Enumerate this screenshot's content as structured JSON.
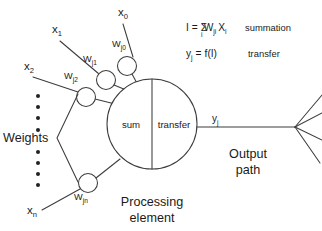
{
  "diagram": {
    "colors": {
      "stroke": "#3c3c3c",
      "text": "#1a1a1a",
      "background": "#ffffff"
    },
    "inputs": [
      {
        "id": "x0",
        "base": "x",
        "sub": "0",
        "x": 118,
        "y": 16
      },
      {
        "id": "x1",
        "base": "x",
        "sub": "1",
        "x": 52,
        "y": 33
      },
      {
        "id": "x2",
        "base": "x",
        "sub": "2",
        "x": 24,
        "y": 70
      },
      {
        "id": "xn",
        "base": "x",
        "sub": "n",
        "x": 27,
        "y": 214
      }
    ],
    "weights": [
      {
        "id": "wj0",
        "base": "W",
        "sub": "j0",
        "label_x": 112,
        "label_y": 47,
        "cx": 127,
        "cy": 66,
        "r": 9.5
      },
      {
        "id": "wj1",
        "base": "W",
        "sub": "j1",
        "label_x": 83,
        "label_y": 62,
        "cx": 106,
        "cy": 80,
        "r": 9.5
      },
      {
        "id": "wj2",
        "base": "W",
        "sub": "j2",
        "label_x": 64,
        "label_y": 79,
        "cx": 86,
        "cy": 97,
        "r": 9.5
      },
      {
        "id": "wjn",
        "base": "W",
        "sub": "jn",
        "label_x": 74,
        "label_y": 200,
        "cx": 88,
        "cy": 183,
        "r": 9.5
      }
    ],
    "processing_element": {
      "sum_label": "sum",
      "transfer_label": "transfer",
      "caption_line1": "Processing",
      "caption_line2": "element",
      "cx": 152,
      "cy": 124,
      "r": 45
    },
    "output": {
      "signal_base": "y",
      "signal_sub": "j",
      "caption_line1": "Output",
      "caption_line2": "path",
      "fan_branches": 4
    },
    "weights_bracket": {
      "label": "Weights",
      "label_x": 3,
      "label_y": 142
    },
    "vertical_dots": {
      "count": 9,
      "x": 38,
      "y_start": 96,
      "y_step": 11.2,
      "radius": 2.0
    },
    "formulas": [
      {
        "id": "summation",
        "lhs": "I",
        "eq": "=",
        "sigma": "Σ",
        "sigma_sub": "i",
        "term1": "W",
        "term1_sub": "ji",
        "term2": "X",
        "term2_sub": "i",
        "annotation": "summation"
      },
      {
        "id": "transfer",
        "lhs": "y",
        "lhs_sub": "j",
        "eq": "=",
        "rhs": "f(I)",
        "annotation": "transfer"
      }
    ]
  }
}
